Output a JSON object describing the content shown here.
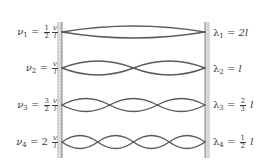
{
  "diagram": {
    "colors": {
      "wave": "#5a5a5a",
      "wall": "#bdbdbd",
      "text": "#3a3a3a"
    },
    "modes": [
      {
        "n": 1,
        "freq_symbol": "ν",
        "freq_sub": "1",
        "freq_coef_num": "1",
        "freq_coef_den": "2",
        "freq_coef_text": "",
        "lambda_symbol": "λ",
        "lambda_sub": "1",
        "lambda_value_text": "2l",
        "lambda_coef_num": "",
        "lambda_coef_den": ""
      },
      {
        "n": 2,
        "freq_symbol": "ν",
        "freq_sub": "2",
        "freq_coef_num": "",
        "freq_coef_den": "",
        "freq_coef_text": "",
        "lambda_symbol": "λ",
        "lambda_sub": "2",
        "lambda_value_text": "l",
        "lambda_coef_num": "",
        "lambda_coef_den": ""
      },
      {
        "n": 3,
        "freq_symbol": "ν",
        "freq_sub": "3",
        "freq_coef_num": "3",
        "freq_coef_den": "2",
        "freq_coef_text": "",
        "lambda_symbol": "λ",
        "lambda_sub": "3",
        "lambda_value_text": "l",
        "lambda_coef_num": "2",
        "lambda_coef_den": "3"
      },
      {
        "n": 4,
        "freq_symbol": "ν",
        "freq_sub": "4",
        "freq_coef_num": "",
        "freq_coef_den": "",
        "freq_coef_text": "2",
        "lambda_symbol": "λ",
        "lambda_sub": "4",
        "lambda_value_text": "l",
        "lambda_coef_num": "1",
        "lambda_coef_den": "2"
      }
    ],
    "ratio": {
      "num": "v",
      "den": "l"
    },
    "equals": "="
  }
}
